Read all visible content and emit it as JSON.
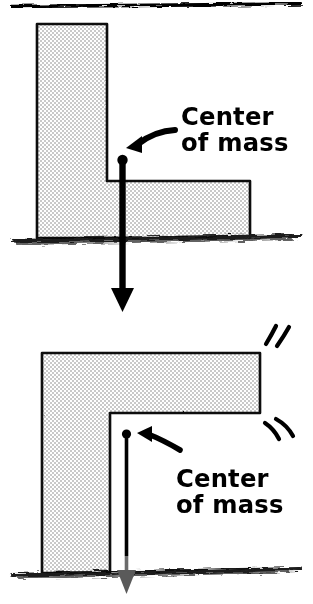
{
  "figure": {
    "title_text_top": "Center\nof mass",
    "title_text_bottom": "Center\nof mass",
    "colors": {
      "ink": "#000000",
      "block_fill": "#d9d9d9",
      "background": "#ffffff",
      "faded_ink": "#6b6b6b"
    },
    "panels": [
      {
        "id": "stable-L-block",
        "caption": "Center\nof mass",
        "block_orientation": "upright-L",
        "stability": "stable",
        "vertical_line_style": "thick-solid",
        "arrow_direction": "down",
        "arrow_reaches_past_ground": true,
        "motion_lines": false
      },
      {
        "id": "tipping-L-block",
        "caption": "Center\nof mass",
        "block_orientation": "rotated-gamma",
        "stability": "tipping",
        "vertical_line_style": "thin-solid",
        "arrow_direction": "down",
        "arrow_reaches_past_ground": true,
        "motion_lines": true
      }
    ],
    "annotations": {
      "pointer_top": "curved-arrow-pointing-down-left",
      "pointer_bottom": "curved-arrow-pointing-up-left",
      "center_of_mass_marker": "filled-dot",
      "ground": "rough-hand-drawn-ground-line",
      "top_rule": "horizontal-divider-rule"
    }
  }
}
